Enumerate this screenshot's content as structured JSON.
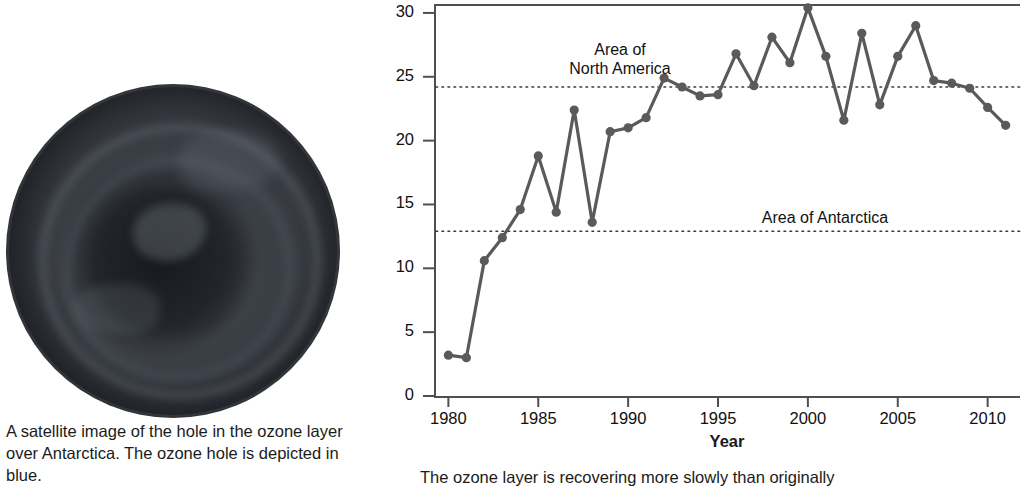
{
  "figure": {
    "left_panel": {
      "image_name": "antarctic-ozone-hole-satellite-image",
      "caption": "A satellite image of the hole in the ozone layer over Antarctica. The ozone hole is depicted in blue."
    },
    "right_panel": {
      "caption": "The ozone layer is recovering more slowly than originally"
    }
  },
  "chart_data": {
    "type": "line",
    "title": "",
    "xlabel": "Year",
    "ylabel": "Size (million Sq km)",
    "ylabel_parts": {
      "plain": "Size (",
      "italic": "million Sq km",
      "close": ")"
    },
    "xlim": [
      1979.2,
      2011.8
    ],
    "ylim": [
      0,
      30.7
    ],
    "xticks": [
      1980,
      1985,
      1990,
      1995,
      2000,
      2005,
      2010
    ],
    "xticklabels": [
      "1980",
      "1985",
      "1990",
      "1995",
      "2000",
      "2005",
      "2010"
    ],
    "yticks": [
      0,
      5,
      10,
      15,
      20,
      25,
      30
    ],
    "yticklabels": [
      "0",
      "5",
      "10",
      "15",
      "20",
      "25",
      "30"
    ],
    "grid": false,
    "legend": "none",
    "line_color": "#5a5a5a",
    "marker_color": "#5a5a5a",
    "axis_color": "#4f4f4f",
    "x": [
      1980,
      1981,
      1982,
      1983,
      1984,
      1985,
      1986,
      1987,
      1988,
      1989,
      1990,
      1991,
      1992,
      1993,
      1994,
      1995,
      1996,
      1997,
      1998,
      1999,
      2000,
      2001,
      2002,
      2003,
      2004,
      2005,
      2006,
      2007,
      2008,
      2009,
      2010,
      2011
    ],
    "values": [
      3.2,
      3.0,
      10.6,
      12.4,
      14.6,
      18.8,
      14.4,
      22.4,
      13.6,
      20.7,
      21.0,
      21.8,
      24.9,
      24.2,
      23.5,
      23.6,
      26.8,
      24.3,
      28.1,
      26.1,
      30.4,
      26.6,
      21.6,
      28.4,
      22.8,
      26.6,
      29.0,
      24.7,
      24.5,
      24.1,
      22.6,
      21.2
    ],
    "reference_lines": [
      {
        "name": "north-america",
        "label": "Area of\nNorth America",
        "value": 24.2,
        "style": "dotted"
      },
      {
        "name": "antarctica",
        "label": "Area of Antarctica",
        "value": 12.9,
        "style": "dotted"
      }
    ]
  }
}
